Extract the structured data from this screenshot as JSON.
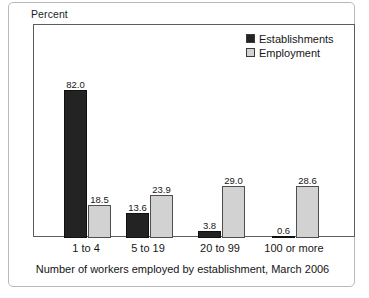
{
  "frame": {
    "y_axis_label": "Percent",
    "caption": "Number of workers employed by establishment, March 2006"
  },
  "legend": {
    "items": [
      {
        "label": "Establishments",
        "swatch": "dark-square-swatch",
        "color": "#232323"
      },
      {
        "label": "Employment",
        "swatch": "light-square-swatch",
        "color": "#d2d2d2"
      }
    ]
  },
  "chart_data": {
    "type": "bar",
    "title": "",
    "subtitle": "",
    "xlabel": "Number of workers employed by establishment, March 2006",
    "ylabel": "Percent",
    "categories": [
      "1 to 4",
      "5 to 19",
      "20 to 99",
      "100 or more"
    ],
    "series": [
      {
        "name": "Establishments",
        "color": "#232323",
        "values": [
          82.0,
          13.6,
          3.8,
          0.6
        ],
        "labels": [
          "82.0",
          "13.6",
          "3.8",
          "0.6"
        ]
      },
      {
        "name": "Employment",
        "color": "#d2d2d2",
        "values": [
          18.5,
          23.9,
          29.0,
          28.6
        ],
        "labels": [
          "18.5",
          "23.9",
          "29.0",
          "28.6"
        ]
      }
    ],
    "ylim": [
      0,
      90
    ],
    "grid": false,
    "legend_position": "top-right",
    "value_labels_shown": true,
    "y_tick_labels": [],
    "units": "percent"
  }
}
